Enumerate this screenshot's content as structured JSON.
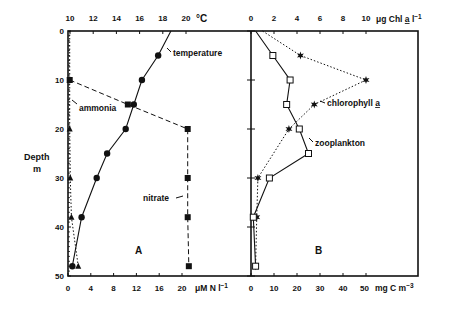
{
  "chart_data": [
    {
      "panel": "A",
      "type": "line",
      "ylabel": "Depth m",
      "y_axis": {
        "label": "Depth",
        "unit": "m",
        "range": [
          0,
          50
        ],
        "ticks": [
          0,
          10,
          20,
          30,
          40,
          50
        ],
        "inverted": true
      },
      "top_axis": {
        "unit": "°C",
        "range": [
          10,
          20
        ],
        "ticks": [
          10,
          12,
          14,
          16,
          18,
          20
        ]
      },
      "bottom_axis": {
        "unit": "μM N l−1",
        "range": [
          0,
          20
        ],
        "ticks": [
          0,
          4,
          8,
          12,
          16,
          20
        ]
      },
      "series": [
        {
          "name": "temperature",
          "axis": "top",
          "style": "solid",
          "marker": "circle",
          "depth": [
            0,
            5,
            10,
            15,
            20,
            25,
            30,
            38,
            48
          ],
          "values": [
            18.7,
            17.6,
            16.2,
            15.5,
            14.8,
            13.2,
            12.3,
            11.0,
            10.2
          ]
        },
        {
          "name": "nitrate",
          "axis": "bottom",
          "style": "dashed",
          "marker": "square",
          "depth": [
            10,
            15,
            20,
            30,
            38,
            48
          ],
          "values": [
            0.3,
            10.5,
            21.0,
            21.0,
            21.0,
            21.2
          ]
        },
        {
          "name": "ammonia",
          "axis": "bottom",
          "style": "dotted",
          "marker": "triangle",
          "depth": [
            0,
            10,
            20,
            30,
            38,
            48
          ],
          "values": [
            0.3,
            0.3,
            0.3,
            0.4,
            0.6,
            1.8
          ]
        }
      ],
      "annotations": [
        "temperature",
        "ammonia",
        "nitrate",
        "A"
      ]
    },
    {
      "panel": "B",
      "type": "line",
      "y_axis": {
        "label": "Depth",
        "unit": "m",
        "range": [
          0,
          50
        ],
        "inverted": true
      },
      "top_axis": {
        "unit": "μg Chl a l−1",
        "range": [
          0,
          10
        ],
        "ticks": [
          0,
          2,
          4,
          6,
          8,
          10
        ]
      },
      "bottom_axis": {
        "unit": "mg C m−3",
        "range": [
          0,
          50
        ],
        "ticks": [
          0,
          10,
          20,
          30,
          40,
          50
        ]
      },
      "series": [
        {
          "name": "chlorophyll a",
          "axis": "top",
          "style": "dotted",
          "marker": "star",
          "depth": [
            0,
            5,
            10,
            15,
            20,
            30,
            38,
            48
          ],
          "values": [
            1.0,
            4.3,
            10.0,
            5.5,
            3.3,
            0.6,
            0.5,
            0.4
          ]
        },
        {
          "name": "zooplankton",
          "axis": "bottom",
          "style": "solid",
          "marker": "open-square",
          "depth": [
            0,
            5,
            10,
            15,
            20,
            25,
            30,
            38,
            48
          ],
          "values": [
            2,
            9.5,
            17,
            15.5,
            21,
            25,
            8,
            1,
            2
          ]
        }
      ],
      "annotations": [
        "chlorophyll a",
        "zooplankton",
        "B"
      ]
    }
  ],
  "labels": {
    "depth": "Depth",
    "depth_unit": "m",
    "temp_unit": "°C",
    "nitrogen_unit": "μM N l",
    "chl_unit_prefix": "μg Chl ",
    "chl_unit_a": "a",
    "chl_unit_suffix": " l",
    "carbon_unit": "mg C m",
    "temperature": "temperature",
    "ammonia": "ammonia",
    "nitrate": "nitrate",
    "chlorophyll": "chlorophyll ",
    "chlorophyll_a": "a",
    "zooplankton": "zooplankton",
    "panel_a": "A",
    "panel_b": "B"
  }
}
